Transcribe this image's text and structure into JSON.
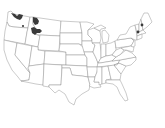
{
  "map": {
    "type": "species-range-map",
    "region": "Contiguous United States",
    "colors": {
      "background": "#ffffff",
      "state_fill": "#ffffff",
      "state_border": "#8a8a8a",
      "range_fill": "#3a3a3a"
    },
    "range_areas": [
      {
        "label": "Northern Washington / Idaho panhandle",
        "shape": "patch"
      },
      {
        "label": "Northwest Montana",
        "shape": "patch"
      },
      {
        "label": "West-central Montana",
        "shape": "patch"
      },
      {
        "label": "Central Washington",
        "shape": "dot"
      },
      {
        "label": "Northern New York",
        "shape": "dot"
      },
      {
        "label": "Northern Vermont / New Hampshire",
        "shape": "dot"
      }
    ]
  }
}
